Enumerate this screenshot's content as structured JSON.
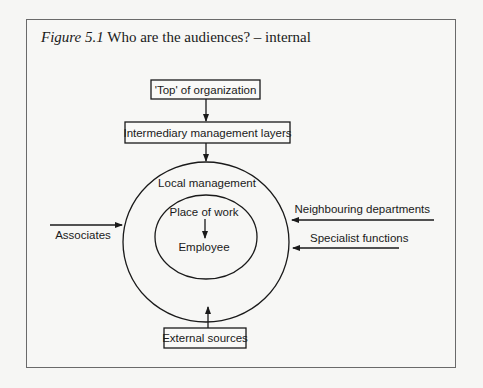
{
  "figure": {
    "label": "Figure 5.1",
    "title": "Who are the audiences? – internal"
  },
  "diagram": {
    "boxes": {
      "top": "'Top' of organization",
      "intermediary": "Intermediary management layers",
      "external": "External sources"
    },
    "circles": {
      "outer": "Local management",
      "inner_top": "Place of work",
      "inner_center": "Employee"
    },
    "side_inputs": {
      "left": "Associates",
      "right_upper": "Neighbouring departments",
      "right_lower": "Specialist functions"
    }
  }
}
